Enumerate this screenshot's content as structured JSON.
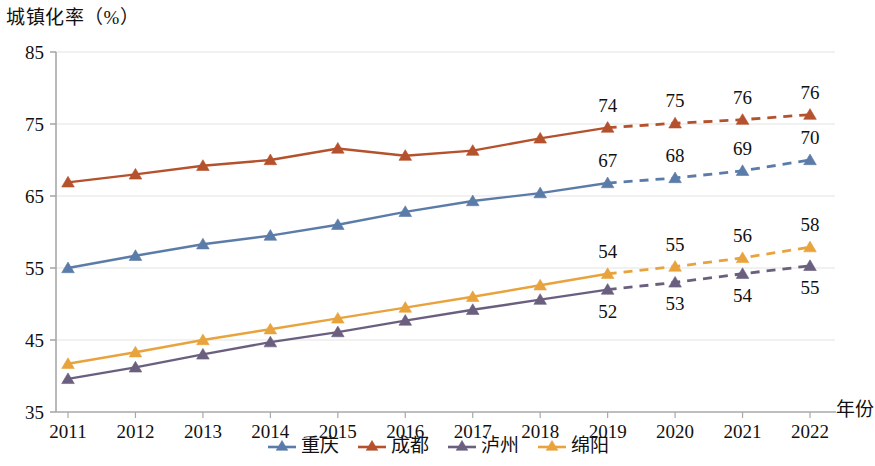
{
  "chart_data": {
    "type": "line",
    "title": "城镇化率（%）",
    "xlabel": "年份",
    "ylabel": "城镇化率（%）",
    "ylim": [
      35,
      85
    ],
    "ytick_labels": [
      "85",
      "75",
      "65",
      "55",
      "45",
      "35"
    ],
    "ytick_values": [
      85,
      75,
      65,
      55,
      45,
      35
    ],
    "grid": "horizontal",
    "legend_position": "bottom-center",
    "categories": [
      "2011",
      "2012",
      "2013",
      "2014",
      "2015",
      "2016",
      "2017",
      "2018",
      "2019",
      "2020",
      "2021",
      "2022"
    ],
    "forecast_start_index": 8,
    "forecast_note": "实线为历史值，2019年起虚线为预测值",
    "series": [
      {
        "name": "重庆",
        "color": "#5B7CA8",
        "marker": "triangle",
        "values": [
          55.0,
          56.7,
          58.3,
          59.5,
          61.0,
          62.8,
          64.3,
          65.4,
          66.8,
          67.5,
          68.5,
          70.0
        ],
        "labels": [
          null,
          null,
          null,
          null,
          null,
          null,
          null,
          null,
          "67",
          "68",
          "69",
          "70"
        ]
      },
      {
        "name": "成都",
        "color": "#B5512C",
        "marker": "triangle",
        "values": [
          66.9,
          68.0,
          69.2,
          70.0,
          71.6,
          70.6,
          71.3,
          73.0,
          74.5,
          75.1,
          75.6,
          76.3
        ],
        "labels": [
          null,
          null,
          null,
          null,
          null,
          null,
          null,
          null,
          "74",
          "75",
          "76",
          "76"
        ]
      },
      {
        "name": "泸州",
        "color": "#6B5F80",
        "marker": "triangle",
        "values": [
          39.6,
          41.2,
          43.0,
          44.7,
          46.1,
          47.7,
          49.2,
          50.6,
          52.0,
          53.0,
          54.2,
          55.3
        ],
        "labels": [
          null,
          null,
          null,
          null,
          null,
          null,
          null,
          null,
          "52",
          "53",
          "54",
          "55"
        ]
      },
      {
        "name": "绵阳",
        "color": "#E8A33D",
        "marker": "triangle",
        "values": [
          41.7,
          43.3,
          45.0,
          46.5,
          48.0,
          49.5,
          51.0,
          52.6,
          54.2,
          55.2,
          56.4,
          57.9
        ],
        "labels": [
          null,
          null,
          null,
          null,
          null,
          null,
          null,
          null,
          "54",
          "55",
          "56",
          "58"
        ]
      }
    ]
  },
  "legend": {
    "items": [
      {
        "label": "重庆",
        "color": "#5B7CA8"
      },
      {
        "label": "成都",
        "color": "#B5512C"
      },
      {
        "label": "泸州",
        "color": "#6B5F80"
      },
      {
        "label": "绵阳",
        "color": "#E8A33D"
      }
    ]
  }
}
